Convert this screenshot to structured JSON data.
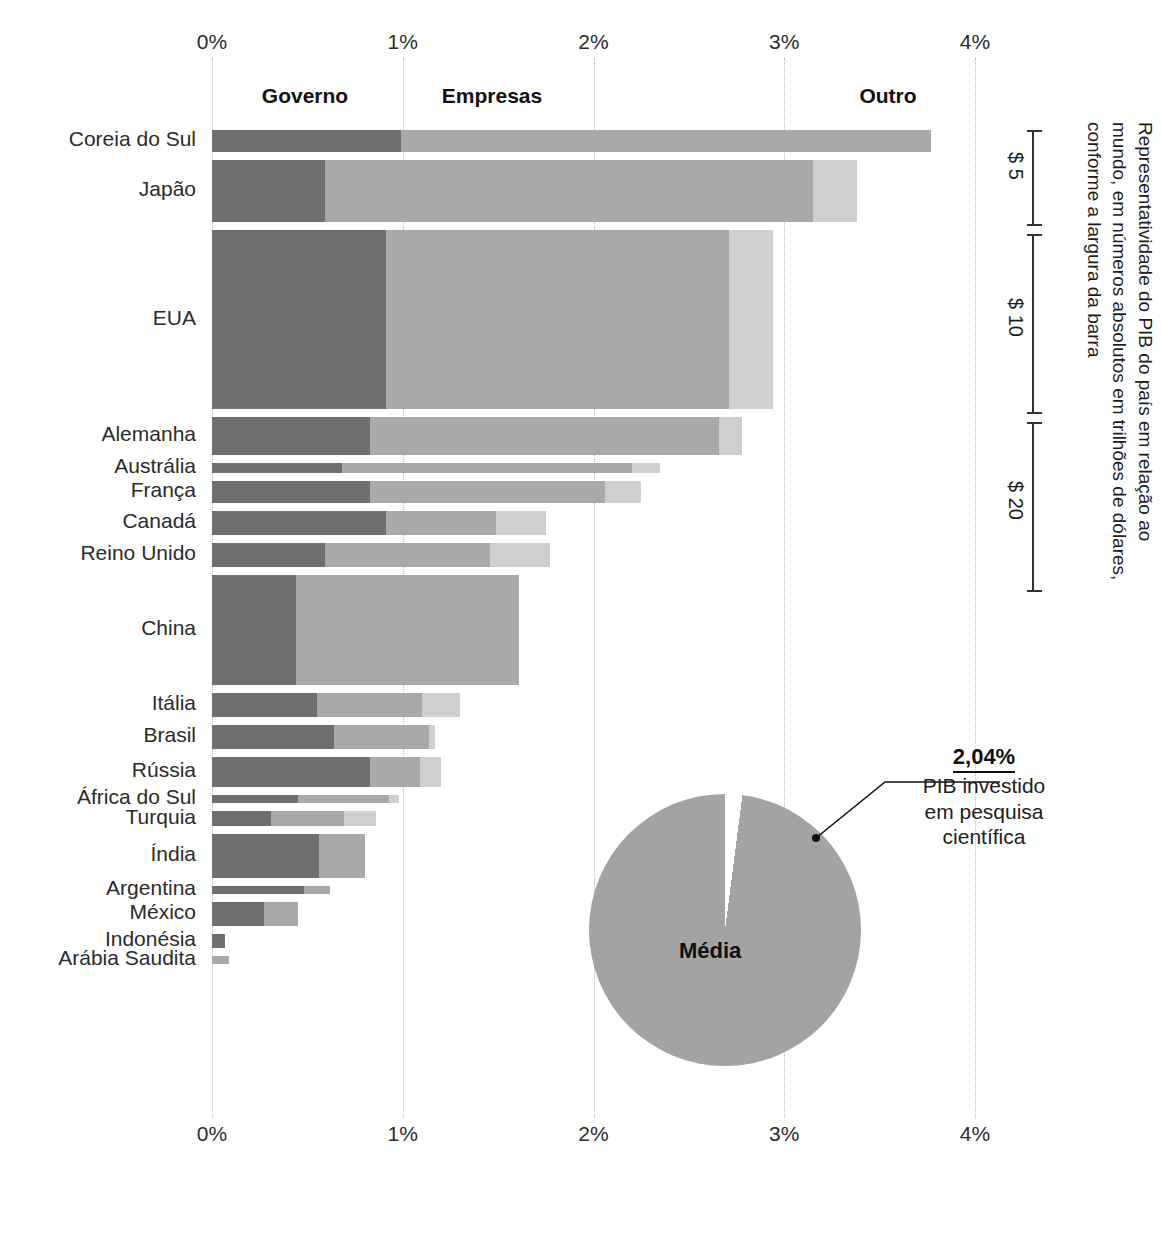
{
  "chart_data": {
    "type": "bar",
    "subtype": "horizontal stacked bar with variable bar thickness",
    "title": "",
    "xlabel": "",
    "ylabel": "",
    "xlim": [
      0,
      4
    ],
    "x_tick_labels": [
      "0%",
      "1%",
      "2%",
      "3%",
      "4%"
    ],
    "x_tick_values": [
      0,
      1,
      2,
      3,
      4
    ],
    "grid": true,
    "legend_position": "top",
    "series": [
      {
        "name": "Governo",
        "color": "#6f6f6f"
      },
      {
        "name": "Empresas",
        "color": "#a9a9a9"
      },
      {
        "name": "Outro",
        "color": "#cfcfcf"
      }
    ],
    "categories": [
      "Coreia do Sul",
      "Japão",
      "EUA",
      "Alemanha",
      "Austrália",
      "França",
      "Canadá",
      "Reino Unido",
      "China",
      "Itália",
      "Brasil",
      "Rússia",
      "África do Sul",
      "Turquia",
      "Índia",
      "Argentina",
      "México",
      "Indonésia",
      "Arábia Saudita"
    ],
    "units_note": "valores em % do PIB; a espessura da barra representa o PIB absoluto em trilhões de dólares",
    "rows": [
      {
        "country": "Coreia do Sul",
        "governo": 0.99,
        "empresas": 2.78,
        "outro": 0.0,
        "total": 3.77,
        "thickness": 22
      },
      {
        "country": "Japão",
        "governo": 0.59,
        "empresas": 2.56,
        "outro": 0.23,
        "total": 3.38,
        "thickness": 62
      },
      {
        "country": "EUA",
        "governo": 0.91,
        "empresas": 1.8,
        "outro": 0.23,
        "total": 2.94,
        "thickness": 179
      },
      {
        "country": "Alemanha",
        "governo": 0.83,
        "empresas": 1.83,
        "outro": 0.12,
        "total": 2.78,
        "thickness": 38
      },
      {
        "country": "Austrália",
        "governo": 0.68,
        "empresas": 1.52,
        "outro": 0.15,
        "total": 2.35,
        "thickness": 10
      },
      {
        "country": "França",
        "governo": 0.83,
        "empresas": 1.23,
        "outro": 0.19,
        "total": 2.25,
        "thickness": 22
      },
      {
        "country": "Canadá",
        "governo": 0.91,
        "empresas": 0.58,
        "outro": 0.26,
        "total": 1.75,
        "thickness": 24
      },
      {
        "country": "Reino Unido",
        "governo": 0.59,
        "empresas": 0.87,
        "outro": 0.31,
        "total": 1.77,
        "thickness": 24
      },
      {
        "country": "China",
        "governo": 0.44,
        "empresas": 1.17,
        "outro": 0.0,
        "total": 1.61,
        "thickness": 110
      },
      {
        "country": "Itália",
        "governo": 0.55,
        "empresas": 0.55,
        "outro": 0.2,
        "total": 1.3,
        "thickness": 24
      },
      {
        "country": "Brasil",
        "governo": 0.64,
        "empresas": 0.5,
        "outro": 0.03,
        "total": 1.17,
        "thickness": 24
      },
      {
        "country": "Rússia",
        "governo": 0.83,
        "empresas": 0.26,
        "outro": 0.11,
        "total": 1.2,
        "thickness": 30
      },
      {
        "country": "África do Sul",
        "governo": 0.45,
        "empresas": 0.48,
        "outro": 0.05,
        "total": 0.98,
        "thickness": 8
      },
      {
        "country": "Turquia",
        "governo": 0.31,
        "empresas": 0.38,
        "outro": 0.17,
        "total": 0.86,
        "thickness": 15
      },
      {
        "country": "Índia",
        "governo": 0.56,
        "empresas": 0.24,
        "outro": 0.0,
        "total": 0.8,
        "thickness": 44
      },
      {
        "country": "Argentina",
        "governo": 0.48,
        "empresas": 0.14,
        "outro": 0.0,
        "total": 0.62,
        "thickness": 8
      },
      {
        "country": "México",
        "governo": 0.27,
        "empresas": 0.18,
        "outro": 0.0,
        "total": 0.45,
        "thickness": 24
      },
      {
        "country": "Indonésia",
        "governo": 0.07,
        "empresas": 0.0,
        "outro": 0.0,
        "total": 0.07,
        "thickness": 14
      },
      {
        "country": "Arábia Saudita",
        "governo": 0.0,
        "empresas": 0.09,
        "outro": 0.0,
        "total": 0.09,
        "thickness": 8
      }
    ],
    "pie": {
      "label_center": "Média",
      "highlight_value": "2,04%",
      "highlight_caption_line1": "PIB investido",
      "highlight_caption_line2": "em pesquisa",
      "highlight_caption_line3": "científica",
      "slices": [
        {
          "name": "Média",
          "value": 97.96,
          "color": "#a3a3a3"
        },
        {
          "name": "2,04%",
          "value": 2.04,
          "color": "#ffffff"
        }
      ]
    },
    "side_note": "Representatividade do PIB do país em relação ao mundo, em números absolutos em trilhões de dólares, conforme a largura da barra",
    "scale_brackets": [
      {
        "label": "$ 5"
      },
      {
        "label": "$ 10"
      },
      {
        "label": "$ 20"
      }
    ]
  }
}
